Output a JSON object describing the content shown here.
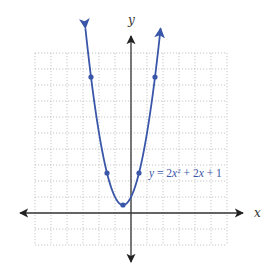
{
  "chart_data": {
    "type": "line",
    "title": "",
    "xlabel": "x",
    "ylabel": "y",
    "xlim": [
      -6,
      6
    ],
    "ylim": [
      -2,
      10
    ],
    "grid": true,
    "grid_style": "dotted",
    "tick_labels": false,
    "axes_arrows": true,
    "series": [
      {
        "name": "y = 2x² + 2x + 1",
        "function": "2x^2 + 2x + 1",
        "x_range": [
          -2.85,
          1.85
        ],
        "arrows_both_ends": true,
        "color": "#3a56a8",
        "points": [
          {
            "x": -2.5,
            "y": 8.5
          },
          {
            "x": -1.5,
            "y": 2.5
          },
          {
            "x": -0.5,
            "y": 0.5
          },
          {
            "x": 0.5,
            "y": 2.5
          },
          {
            "x": 1.5,
            "y": 8.5
          }
        ]
      }
    ],
    "annotations": [
      {
        "text": "y = 2x² + 2x + 1",
        "near": {
          "x": 0.7,
          "y": 3.3
        }
      }
    ]
  },
  "labels": {
    "x_axis": "x",
    "y_axis": "y",
    "equation": {
      "y": "y",
      "eq": " = 2",
      "x1": "x",
      "sup": "2",
      "rest": " + 2",
      "x2": "x",
      "tail": " + 1"
    }
  },
  "colors": {
    "curve": "#3a56a8",
    "axis": "#333333",
    "grid": "#b8b8b8"
  }
}
